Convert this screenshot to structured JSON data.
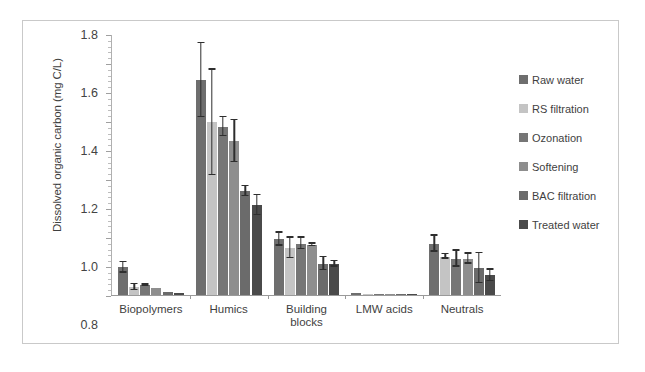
{
  "chart_data": {
    "type": "bar",
    "title": "",
    "xlabel": "",
    "ylabel": "Dissolved organic carbon (mg C/L)",
    "ylim": [
      0.0,
      1.8
    ],
    "ytick_labels": [
      "0.0",
      "0.2",
      "0.4",
      "0.6",
      "0.8",
      "1.0",
      "1.2",
      "1.4",
      "1.6",
      "1.8"
    ],
    "ytick_values": [
      0.0,
      0.2,
      0.4,
      0.6,
      0.8,
      1.0,
      1.2,
      1.4,
      1.6,
      1.8
    ],
    "minor_ticks_per_interval": 4,
    "grid": false,
    "legend_position": "right",
    "categories": [
      "Biopolymers",
      "Humics",
      "Building blocks",
      "LMW acids",
      "Neutrals"
    ],
    "category_lines": [
      [
        "Biopolymers"
      ],
      [
        "Humics"
      ],
      [
        "Building",
        "blocks"
      ],
      [
        "LMW acids"
      ],
      [
        "Neutrals"
      ]
    ],
    "series": [
      {
        "name": "Raw water",
        "color": "#6e6e6e",
        "values": [
          0.19,
          1.48,
          0.385,
          0.012,
          0.355
        ],
        "errors": [
          0.035,
          0.255,
          0.045,
          0.004,
          0.055
        ]
      },
      {
        "name": "RS filtration",
        "color": "#c4c4c4",
        "values": [
          0.055,
          1.19,
          0.325,
          0.008,
          0.265
        ],
        "errors": [
          0.02,
          0.365,
          0.07,
          0.003,
          0.015
        ]
      },
      {
        "name": "Ozonation",
        "color": "#767676",
        "values": [
          0.07,
          1.16,
          0.355,
          0.008,
          0.25
        ],
        "errors": [
          0.005,
          0.065,
          0.04,
          0.003,
          0.055
        ]
      },
      {
        "name": "Softening",
        "color": "#8e8e8e",
        "values": [
          0.05,
          1.06,
          0.345,
          0.008,
          0.25
        ],
        "errors": [
          0.004,
          0.145,
          0.008,
          0.003,
          0.035
        ]
      },
      {
        "name": "BAC filtration",
        "color": "#6b6b6b",
        "values": [
          0.02,
          0.715,
          0.215,
          0.006,
          0.185
        ],
        "errors": [
          0.004,
          0.035,
          0.045,
          0.003,
          0.105
        ]
      },
      {
        "name": "Treated water",
        "color": "#4a4a4a",
        "values": [
          0.012,
          0.62,
          0.215,
          0.006,
          0.135
        ],
        "errors": [
          0.003,
          0.07,
          0.02,
          0.003,
          0.04
        ]
      }
    ]
  },
  "legend": {
    "items": [
      {
        "label": "Raw water"
      },
      {
        "label": "RS filtration"
      },
      {
        "label": "Ozonation"
      },
      {
        "label": "Softening"
      },
      {
        "label": "BAC filtration"
      },
      {
        "label": "Treated water"
      }
    ]
  }
}
